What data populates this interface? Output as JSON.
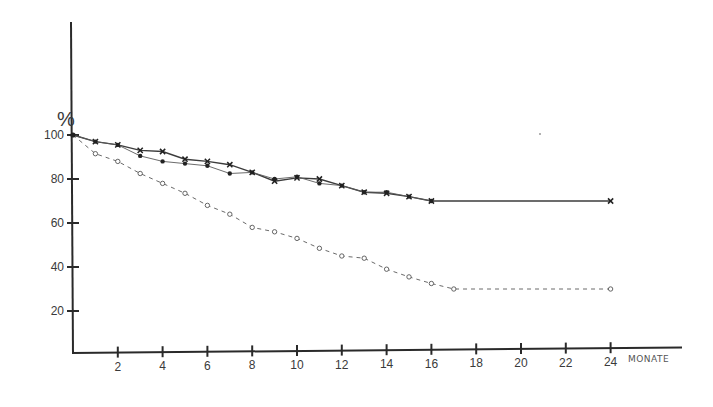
{
  "chart_data": {
    "type": "line",
    "title": "",
    "ylabel": "%",
    "xlabel": "MONATE",
    "xlim": [
      0,
      24
    ],
    "ylim": [
      0,
      100
    ],
    "grid": false,
    "legend": null,
    "x_ticks": [
      2,
      4,
      6,
      8,
      10,
      12,
      14,
      16,
      18,
      20,
      22,
      24
    ],
    "y_ticks": [
      20,
      40,
      60,
      80,
      100
    ],
    "series": [
      {
        "name": "Series with x markers",
        "marker": "x",
        "line_style": "solid",
        "x": [
          0,
          1,
          2,
          3,
          4,
          5,
          6,
          7,
          8,
          9,
          10,
          11,
          12,
          13,
          14,
          15,
          16,
          24
        ],
        "values": [
          100,
          97,
          95.5,
          93,
          92.5,
          89,
          88,
          86.5,
          83,
          79,
          80.5,
          80,
          77,
          74,
          73.5,
          72,
          70,
          70
        ]
      },
      {
        "name": "Series with filled dot markers",
        "marker": "filled-circle",
        "line_style": "solid-thin",
        "x": [
          0,
          1,
          2,
          3,
          4,
          5,
          6,
          7,
          8,
          9,
          10,
          11,
          12,
          13,
          14,
          15,
          16
        ],
        "values": [
          100,
          97,
          95.5,
          90.5,
          88,
          87,
          86,
          82.5,
          83,
          80,
          81,
          78,
          77,
          74,
          74,
          72,
          70
        ]
      },
      {
        "name": "Series with open circle markers",
        "marker": "open-circle",
        "line_style": "dashed",
        "x": [
          0,
          1,
          2,
          3,
          4,
          5,
          6,
          7,
          8,
          9,
          10,
          11,
          12,
          13,
          14,
          15,
          16,
          17,
          24
        ],
        "values": [
          100,
          91.5,
          88,
          82.5,
          78,
          73.5,
          68,
          64,
          58,
          56,
          53,
          48.5,
          45,
          44,
          39,
          35.5,
          32.5,
          30,
          30
        ]
      }
    ]
  },
  "axes": {
    "y_unit": "%",
    "x_unit": "MONATE",
    "y_tick_labels": [
      "20",
      "40",
      "60",
      "80",
      "100"
    ],
    "x_tick_labels": [
      "2",
      "4",
      "6",
      "8",
      "10",
      "12",
      "14",
      "16",
      "18",
      "20",
      "22",
      "24"
    ]
  }
}
